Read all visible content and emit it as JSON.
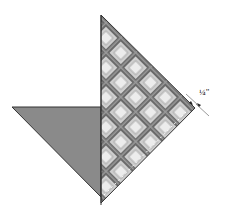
{
  "diagram": {
    "type": "quilt-block-assembly",
    "annotation": {
      "seam_allowance_label": "¼\"",
      "numerator": "1",
      "denominator": "4",
      "unit": "\""
    },
    "colors": {
      "gray_triangle": "#8a8a8a",
      "plaid_dark": "#5a5a5a",
      "plaid_mid": "#9a9a9a",
      "plaid_light": "#e6e6e6",
      "outline": "#333333"
    },
    "pieces": [
      {
        "name": "solid-gray-triangle"
      },
      {
        "name": "plaid-triangle"
      }
    ]
  }
}
